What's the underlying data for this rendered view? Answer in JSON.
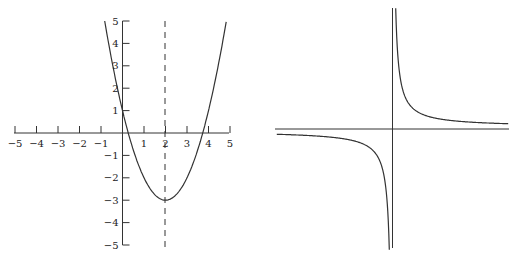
{
  "chart_data": [
    {
      "type": "line",
      "title": "",
      "function": "y = (x - 2)^2 - 3",
      "xlabel": "",
      "ylabel": "",
      "xlim": [
        -5,
        5
      ],
      "ylim": [
        -5,
        5
      ],
      "x_ticks": [
        "-5",
        "-4",
        "-3",
        "-2",
        "-1",
        "1",
        "2",
        "3",
        "4",
        "5"
      ],
      "y_ticks": [
        "5",
        "4",
        "3",
        "2",
        "1",
        "-1",
        "-2",
        "-3",
        "-4",
        "-5"
      ],
      "series": [
        {
          "name": "parabola",
          "x": [
            -0.83,
            0,
            0.27,
            1,
            2,
            3,
            3.73,
            4,
            4.83
          ],
          "y": [
            5,
            1,
            0,
            -2,
            -3,
            -2,
            0,
            1,
            5
          ]
        }
      ],
      "annotations": [
        {
          "type": "dashed-vertical-line",
          "x": 2,
          "label": "axis of symmetry"
        }
      ],
      "grid": false
    },
    {
      "type": "line",
      "title": "",
      "function": "y = k / x",
      "xlabel": "",
      "ylabel": "",
      "series": [
        {
          "name": "hyperbola-branch-positive",
          "shape": "quadrant I"
        },
        {
          "name": "hyperbola-branch-negative",
          "shape": "quadrant III"
        }
      ],
      "ticks": false,
      "grid": false
    }
  ],
  "labels": {
    "x": [
      "−5",
      "−4",
      "−3",
      "−2",
      "−1",
      "1",
      "2",
      "3",
      "4",
      "5"
    ],
    "y": [
      "5",
      "4",
      "3",
      "2",
      "1",
      "−1",
      "−2",
      "−3",
      "−4",
      "−5"
    ]
  }
}
